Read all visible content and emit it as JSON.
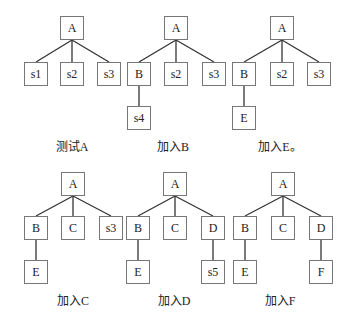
{
  "panels": [
    {
      "caption": "测试A",
      "nodes": [
        {
          "id": "A",
          "label": "A",
          "x": 60,
          "y": 16
        },
        {
          "id": "s1",
          "label": "s1",
          "x": 24,
          "y": 62
        },
        {
          "id": "s2",
          "label": "s2",
          "x": 60,
          "y": 62
        },
        {
          "id": "s3",
          "label": "s3",
          "x": 97,
          "y": 62
        }
      ],
      "edges": [
        [
          "A",
          "s1"
        ],
        [
          "A",
          "s2"
        ],
        [
          "A",
          "s3"
        ]
      ],
      "caption_x": 32,
      "caption_y": 137
    },
    {
      "caption": "加入B",
      "nodes": [
        {
          "id": "A",
          "label": "A",
          "x": 164,
          "y": 16
        },
        {
          "id": "B",
          "label": "B",
          "x": 127,
          "y": 62
        },
        {
          "id": "s2",
          "label": "s2",
          "x": 164,
          "y": 62
        },
        {
          "id": "s3",
          "label": "s3",
          "x": 202,
          "y": 62
        },
        {
          "id": "s4",
          "label": "s4",
          "x": 127,
          "y": 106
        }
      ],
      "edges": [
        [
          "A",
          "B"
        ],
        [
          "A",
          "s2"
        ],
        [
          "A",
          "s3"
        ],
        [
          "B",
          "s4"
        ]
      ],
      "caption_x": 133,
      "caption_y": 137
    },
    {
      "caption": "加入E。",
      "nodes": [
        {
          "id": "A",
          "label": "A",
          "x": 270,
          "y": 16
        },
        {
          "id": "B",
          "label": "B",
          "x": 232,
          "y": 62
        },
        {
          "id": "s2",
          "label": "s2",
          "x": 270,
          "y": 62
        },
        {
          "id": "s3",
          "label": "s3",
          "x": 307,
          "y": 62
        },
        {
          "id": "E",
          "label": "E",
          "x": 232,
          "y": 106
        }
      ],
      "edges": [
        [
          "A",
          "B"
        ],
        [
          "A",
          "s2"
        ],
        [
          "A",
          "s3"
        ],
        [
          "B",
          "E"
        ]
      ],
      "caption_x": 240,
      "caption_y": 137
    },
    {
      "caption": "加入C",
      "nodes": [
        {
          "id": "A",
          "label": "A",
          "x": 61,
          "y": 172
        },
        {
          "id": "B",
          "label": "B",
          "x": 24,
          "y": 216
        },
        {
          "id": "C",
          "label": "C",
          "x": 61,
          "y": 216
        },
        {
          "id": "s3",
          "label": "s3",
          "x": 99,
          "y": 216
        },
        {
          "id": "E",
          "label": "E",
          "x": 24,
          "y": 260
        }
      ],
      "edges": [
        [
          "A",
          "B"
        ],
        [
          "A",
          "C"
        ],
        [
          "A",
          "s3"
        ],
        [
          "B",
          "E"
        ]
      ],
      "caption_x": 33,
      "caption_y": 291
    },
    {
      "caption": "加入D",
      "nodes": [
        {
          "id": "A",
          "label": "A",
          "x": 163,
          "y": 172
        },
        {
          "id": "B",
          "label": "B",
          "x": 126,
          "y": 216
        },
        {
          "id": "C",
          "label": "C",
          "x": 163,
          "y": 216
        },
        {
          "id": "D",
          "label": "D",
          "x": 201,
          "y": 216
        },
        {
          "id": "E",
          "label": "E",
          "x": 126,
          "y": 260
        },
        {
          "id": "s5",
          "label": "s5",
          "x": 201,
          "y": 260
        }
      ],
      "edges": [
        [
          "A",
          "B"
        ],
        [
          "A",
          "C"
        ],
        [
          "A",
          "D"
        ],
        [
          "B",
          "E"
        ],
        [
          "D",
          "s5"
        ]
      ],
      "caption_x": 134,
      "caption_y": 291
    },
    {
      "caption": "加入F",
      "nodes": [
        {
          "id": "A",
          "label": "A",
          "x": 271,
          "y": 172
        },
        {
          "id": "B",
          "label": "B",
          "x": 233,
          "y": 216
        },
        {
          "id": "C",
          "label": "C",
          "x": 271,
          "y": 216
        },
        {
          "id": "D",
          "label": "D",
          "x": 309,
          "y": 216
        },
        {
          "id": "E",
          "label": "E",
          "x": 233,
          "y": 260
        },
        {
          "id": "F",
          "label": "F",
          "x": 309,
          "y": 260
        }
      ],
      "edges": [
        [
          "A",
          "B"
        ],
        [
          "A",
          "C"
        ],
        [
          "A",
          "D"
        ],
        [
          "B",
          "E"
        ],
        [
          "D",
          "F"
        ]
      ],
      "caption_x": 240,
      "caption_y": 291
    }
  ]
}
